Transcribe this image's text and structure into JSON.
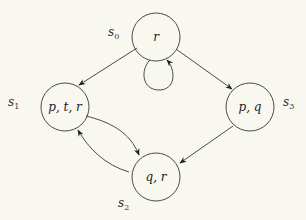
{
  "diagram": {
    "type": "kripke-structure",
    "colors": {
      "background": "#f9f8f0",
      "stroke": "#4a4a4a",
      "text": "#222222"
    },
    "states": [
      {
        "id": "s0",
        "name": "s",
        "index": "0",
        "label": "r",
        "cx": 156,
        "cy": 37
      },
      {
        "id": "s1",
        "name": "s",
        "index": "1",
        "label": "p, t, r",
        "cx": 65,
        "cy": 107
      },
      {
        "id": "s2",
        "name": "s",
        "index": "2",
        "label": "q, r",
        "cx": 156,
        "cy": 177
      },
      {
        "id": "s3",
        "name": "s",
        "index": "3",
        "label": "p, q",
        "cx": 250,
        "cy": 107
      }
    ],
    "transitions": [
      {
        "from": "s0",
        "to": "s1"
      },
      {
        "from": "s0",
        "to": "s3"
      },
      {
        "from": "s0",
        "to": "s0"
      },
      {
        "from": "s1",
        "to": "s2"
      },
      {
        "from": "s2",
        "to": "s1"
      },
      {
        "from": "s3",
        "to": "s2"
      }
    ]
  }
}
